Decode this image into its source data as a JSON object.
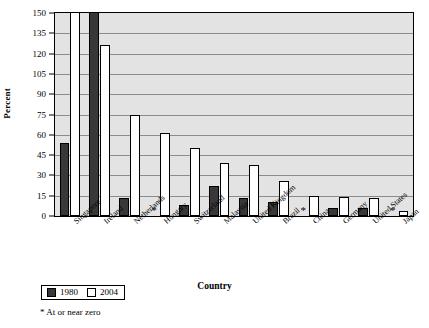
{
  "chart_data": {
    "type": "bar",
    "title": "",
    "xlabel": "Country",
    "ylabel": "Percent",
    "ylim": [
      0,
      150
    ],
    "yticks": [
      0,
      15,
      30,
      45,
      60,
      75,
      90,
      105,
      120,
      135,
      150
    ],
    "grid": true,
    "legend_position": "bottom-left",
    "categories": [
      "Singapore",
      "Ireland",
      "Netherlands",
      "Hungary",
      "Switzerland",
      "Malaysia",
      "United Kingdom",
      "Brazil",
      "China",
      "Germany",
      "United States",
      "Japan"
    ],
    "series": [
      {
        "name": "1980",
        "color": "#383838",
        "values": [
          54,
          163,
          13,
          0,
          8,
          22,
          13,
          10,
          0,
          6,
          6,
          0
        ],
        "clipped": [
          false,
          true,
          false,
          false,
          false,
          false,
          false,
          false,
          false,
          false,
          false,
          false
        ],
        "at_or_near_zero": [
          false,
          false,
          false,
          true,
          false,
          false,
          false,
          false,
          true,
          false,
          false,
          true
        ]
      },
      {
        "name": "2004",
        "color": "#ffffff",
        "values": [
          158,
          126,
          75,
          61,
          50,
          39,
          38,
          26,
          15,
          14,
          13,
          4
        ],
        "clipped": [
          true,
          false,
          false,
          false,
          false,
          false,
          false,
          false,
          false,
          false,
          false,
          false
        ],
        "at_or_near_zero": [
          false,
          false,
          false,
          false,
          false,
          false,
          false,
          false,
          false,
          false,
          false,
          false
        ]
      }
    ],
    "annotations": [
      "* At or near zero"
    ]
  },
  "axes": {
    "y_title": "Percent",
    "x_title": "Country"
  },
  "legend": {
    "items": [
      {
        "label": "1980",
        "swatch": "dark"
      },
      {
        "label": "2004",
        "swatch": "light"
      }
    ]
  },
  "footnote": {
    "text": "* At or near zero"
  },
  "marker": {
    "near_zero_glyph": "*"
  }
}
